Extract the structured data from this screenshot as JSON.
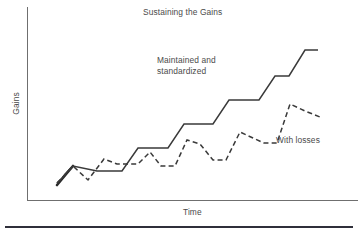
{
  "chart_data": {
    "type": "line",
    "title": "Sustaining the Gains",
    "xlabel": "Time",
    "ylabel": "Gains",
    "grid": false,
    "legend_position": "inline-annotations",
    "axis_origin_px": [
      27,
      200
    ],
    "series": [
      {
        "name": "Maintained and standardized",
        "style": "solid",
        "annotation_lines": [
          "Maintained and",
          "standardized"
        ],
        "points_px": [
          [
            57,
            183
          ],
          [
            62,
            178
          ],
          [
            67,
            172
          ],
          [
            73,
            166
          ],
          [
            97,
            171
          ],
          [
            122,
            171
          ],
          [
            138,
            148
          ],
          [
            168,
            148
          ],
          [
            184,
            124
          ],
          [
            213,
            124
          ],
          [
            229,
            100
          ],
          [
            259,
            100
          ],
          [
            275,
            76
          ],
          [
            289,
            76
          ],
          [
            305,
            50
          ],
          [
            318,
            50
          ]
        ]
      },
      {
        "name": "With losses",
        "style": "dashed",
        "annotation": "With losses",
        "points_px": [
          [
            57,
            183
          ],
          [
            62,
            178
          ],
          [
            67,
            172
          ],
          [
            73,
            166
          ],
          [
            88,
            180
          ],
          [
            104,
            159
          ],
          [
            117,
            164
          ],
          [
            138,
            164
          ],
          [
            150,
            152
          ],
          [
            161,
            166
          ],
          [
            175,
            166
          ],
          [
            187,
            140
          ],
          [
            200,
            144
          ],
          [
            213,
            160
          ],
          [
            226,
            160
          ],
          [
            240,
            132
          ],
          [
            253,
            138
          ],
          [
            264,
            143
          ],
          [
            277,
            143
          ],
          [
            290,
            104
          ],
          [
            305,
            111
          ],
          [
            320,
            117
          ]
        ]
      }
    ],
    "annotations": [
      {
        "id": "maintained",
        "text_lines": [
          "Maintained and",
          "standardized"
        ],
        "x_px": 157,
        "y_px": 55
      },
      {
        "id": "with-losses",
        "text": "With losses",
        "x_px": 276,
        "y_px": 135
      }
    ],
    "colors": {
      "line": "#3a3a3a",
      "axis": "#6f6f6f",
      "text": "#4a4a4a",
      "rule": "#2f2f3a",
      "background": "#ffffff"
    }
  },
  "figure": {
    "title": "Sustaining the Gains",
    "axis": {
      "x_label": "Time",
      "y_label": "Gains"
    },
    "annotations": {
      "maintained_line1": "Maintained and",
      "maintained_line2": "standardized",
      "with_losses": "With losses"
    }
  }
}
